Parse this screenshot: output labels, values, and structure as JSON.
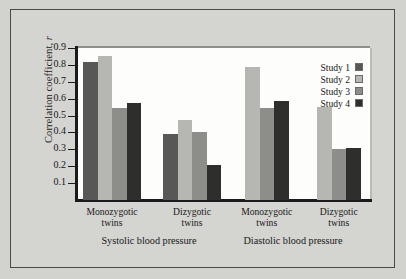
{
  "chart_data": {
    "type": "bar",
    "title": "",
    "xlabel": "",
    "ylabel": "Correlation coefficient, r",
    "ylim": [
      0,
      0.9
    ],
    "ytick_labels": [
      "0.9",
      "0.8",
      "0.7",
      "0.6",
      "0.5",
      "0.4",
      "0.3",
      "0.2",
      "0.1"
    ],
    "ytick_values": [
      0.9,
      0.8,
      0.7,
      0.6,
      0.5,
      0.4,
      0.3,
      0.2,
      0.1
    ],
    "grid": false,
    "legend_position": "top-right",
    "categories": [
      "Monozygotic twins",
      "Dizygotic twins",
      "Monozygotic twins",
      "Dizygotic twins"
    ],
    "panels": [
      "Systolic blood pressure",
      "Diastolic blood pressure"
    ],
    "series": [
      {
        "name": "Study 1",
        "color": "#585856",
        "values": [
          0.815,
          0.39,
          null,
          null
        ]
      },
      {
        "name": "Study 2",
        "color": "#b6b6b2",
        "values": [
          0.855,
          0.475,
          0.785,
          0.55
        ]
      },
      {
        "name": "Study 3",
        "color": "#8d8d89",
        "values": [
          0.545,
          0.405,
          0.545,
          0.3
        ]
      },
      {
        "name": "Study 4",
        "color": "#2e2e2c",
        "values": [
          0.575,
          0.205,
          0.585,
          0.305
        ]
      }
    ]
  },
  "axis": {
    "y_title_main": "Correlation coefficient,",
    "y_title_italic": "r"
  },
  "groups": [
    {
      "line1": "Monozygotic",
      "line2": "twins"
    },
    {
      "line1": "Dizygotic",
      "line2": "twins"
    },
    {
      "line1": "Monozygotic",
      "line2": "twins"
    },
    {
      "line1": "Dizygotic",
      "line2": "twins"
    }
  ],
  "panel_labels": [
    {
      "text": "Systolic blood pressure"
    },
    {
      "text": "Diastolic blood pressure"
    }
  ],
  "legend": {
    "items": [
      {
        "label": "Study 1"
      },
      {
        "label": "Study 2"
      },
      {
        "label": "Study 3"
      },
      {
        "label": "Study 4"
      }
    ]
  }
}
